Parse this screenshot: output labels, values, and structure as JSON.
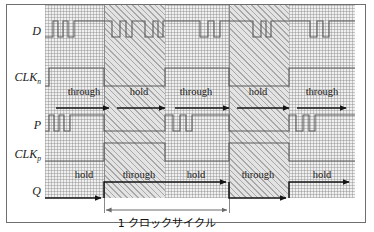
{
  "figure": {
    "type": "timing-diagram",
    "title": "",
    "caption_jp": "1 クロックサイクル",
    "signals": [
      {
        "name": "D",
        "sub": "",
        "label_x": 30,
        "y": 31
      },
      {
        "name": "CLK",
        "sub": "n",
        "label_x": 45,
        "y": 78
      },
      {
        "name": "P",
        "sub": "",
        "label_x": 30,
        "y": 125
      },
      {
        "name": "CLK",
        "sub": "p",
        "label_x": 45,
        "y": 155
      },
      {
        "name": "Q",
        "sub": "",
        "label_x": 30,
        "y": 191
      }
    ],
    "bands": [
      {
        "pattern": "dot",
        "x": 45,
        "width": 59
      },
      {
        "pattern": "hatch",
        "x": 104,
        "width": 61
      },
      {
        "pattern": "dot",
        "x": 165,
        "width": 64
      },
      {
        "pattern": "hatch",
        "x": 229,
        "width": 60
      },
      {
        "pattern": "dot",
        "x": 289,
        "width": 66
      }
    ],
    "dividers": [
      104,
      229
    ],
    "states_p": [
      {
        "label": "through",
        "x": 84
      },
      {
        "label": "hold",
        "x": 139
      },
      {
        "label": "through",
        "x": 196
      },
      {
        "label": "hold",
        "x": 258
      },
      {
        "label": "through",
        "x": 322
      }
    ],
    "states_q": [
      {
        "label": "hold",
        "x": 84
      },
      {
        "label": "through",
        "x": 139
      },
      {
        "label": "hold",
        "x": 196
      },
      {
        "label": "through",
        "x": 258
      },
      {
        "label": "hold",
        "x": 322
      }
    ],
    "waveforms": {
      "D": "M45,37 L53,37 L53,21 L58,21 L58,37 L63,37 L63,21 L68,21 L68,37 L74,37 L74,21 L112,21 L112,37 L120,37 L120,21 L126,21 L126,37 L132,37 L132,21 L145,21 L145,37 L153,37 L153,21 L158,21 L158,37 L163,37 L163,21 L200,21 L200,37 L208,37 L208,21 L214,21 L214,37 L220,37 L220,21 L253,21 L253,37 L261,37 L261,21 L266,21 L266,37 L271,37 L271,21 L310,21 L310,37 L317,37 L317,21 L323,21 L323,37 L329,37 L329,21 L355,21",
      "CLKn": "M45,86 L49,86 L49,68 L104,68 L104,86 L165,86 L165,68 L229,68 L229,86 L289,86 L289,68 L355,68",
      "P": "M45,131 L49,131 L49,115 L54,115 L54,131 L59,131 L59,115 L64,115 L64,131 L70,131 L70,115 L104,115 L104,131 L165,131 L165,115 L173,115 L173,131 L180,131 L180,115 L186,115 L186,131 L192,131 L192,115 L229,115 L229,131 L289,131 L289,115 L296,115 L296,131 L303,131 L303,115 L309,115 L309,131 L315,131 L315,115 L355,115",
      "CLKp": "M45,161 L104,161 L104,143 L165,143 L165,161 L229,161 L229,143 L289,143 L289,161 L355,161"
    },
    "q_arrows": [
      {
        "type": "q-waveform",
        "d": "M45,198 L104,198"
      },
      {
        "type": "q-waveform",
        "d": "M104,198 L104,181 L229,181"
      },
      {
        "type": "q-waveform",
        "d": "M229,181 L229,198 L289,198"
      },
      {
        "type": "q-waveform",
        "d": "M289,198 L289,181 L352,181"
      }
    ],
    "p_arrows": [
      {
        "from_x": 58,
        "to_x": 112,
        "y": 108
      },
      {
        "from_x": 118,
        "to_x": 168,
        "y": 108
      },
      {
        "from_x": 176,
        "to_x": 232,
        "y": 108
      },
      {
        "from_x": 238,
        "to_x": 292,
        "y": 108
      },
      {
        "from_x": 298,
        "to_x": 348,
        "y": 108
      }
    ],
    "cycle_measure": {
      "x1": 104,
      "x2": 229,
      "y": 210
    }
  }
}
